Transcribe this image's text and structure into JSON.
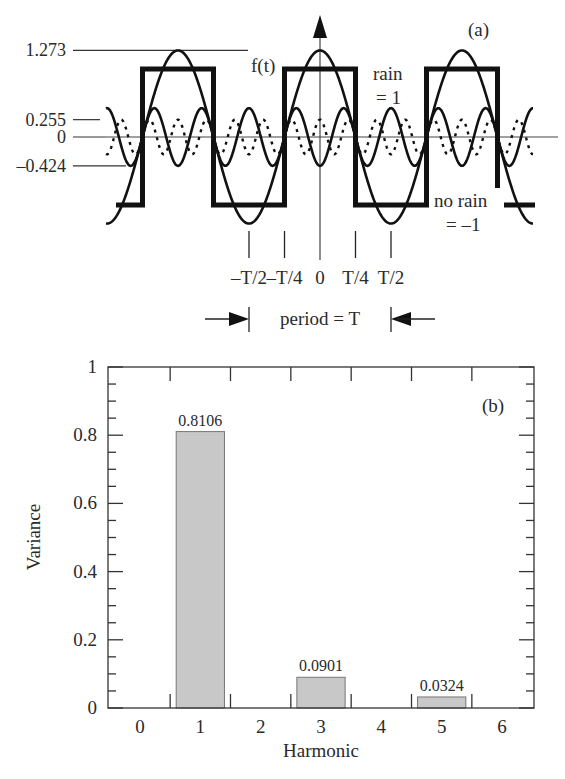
{
  "chart_data": [
    {
      "panel": "a",
      "type": "line",
      "panel_label": "(a)",
      "title": "",
      "function_label": "f(t)",
      "description": "Square wave f(t) (rain = 1, no rain = -1) with its 1st, 3rd and 5th Fourier harmonics",
      "x_ticks": [
        "–T/2",
        "–T/4",
        "0",
        "T/4",
        "T/2"
      ],
      "x_tick_values": [
        -0.5,
        -0.25,
        0,
        0.25,
        0.5
      ],
      "x_unit": "period T",
      "xlim_periods": [
        -1.51,
        1.51
      ],
      "ylim": [
        -1.35,
        1.35
      ],
      "y_reference_levels": [
        {
          "label": "1.273",
          "value": 1.273
        },
        {
          "label": "0.255",
          "value": 0.255
        },
        {
          "label": "0",
          "value": 0
        },
        {
          "label": "–0.424",
          "value": -0.424
        }
      ],
      "annotations": {
        "rain_line1": "rain",
        "rain_line2": "= 1",
        "norain_line1": "no rain",
        "norain_line2": "= –1",
        "period": "period = T"
      },
      "series": [
        {
          "name": "square wave f(t)",
          "kind": "square",
          "high": 1,
          "low": -1,
          "style": "thick"
        },
        {
          "name": "harmonic 1",
          "kind": "cos",
          "harmonic": 1,
          "amplitude": 1.273,
          "style": "solid"
        },
        {
          "name": "harmonic 3",
          "kind": "cos",
          "harmonic": 3,
          "amplitude": -0.424,
          "style": "solid"
        },
        {
          "name": "harmonic 5",
          "kind": "cos",
          "harmonic": 5,
          "amplitude": 0.255,
          "style": "dotted"
        }
      ]
    },
    {
      "panel": "b",
      "type": "bar",
      "panel_label": "(b)",
      "title": "",
      "xlabel": "Harmonic",
      "ylabel": "Variance",
      "categories": [
        "0",
        "1",
        "2",
        "3",
        "4",
        "5",
        "6"
      ],
      "x_tick_values": [
        0,
        1,
        2,
        3,
        4,
        5,
        6
      ],
      "bars": [
        {
          "harmonic": 1,
          "value": 0.8106,
          "label": "0.8106"
        },
        {
          "harmonic": 3,
          "value": 0.0901,
          "label": "0.0901"
        },
        {
          "harmonic": 5,
          "value": 0.0324,
          "label": "0.0324"
        }
      ],
      "y_ticks": [
        "0",
        "0.2",
        "0.4",
        "0.6",
        "0.8",
        "1"
      ],
      "y_tick_values": [
        0,
        0.2,
        0.4,
        0.6,
        0.8,
        1.0
      ],
      "ylim": [
        0,
        1
      ],
      "xlim": [
        -0.53,
        6.53
      ],
      "bar_color": "#c8c8c8",
      "grid": false
    }
  ]
}
